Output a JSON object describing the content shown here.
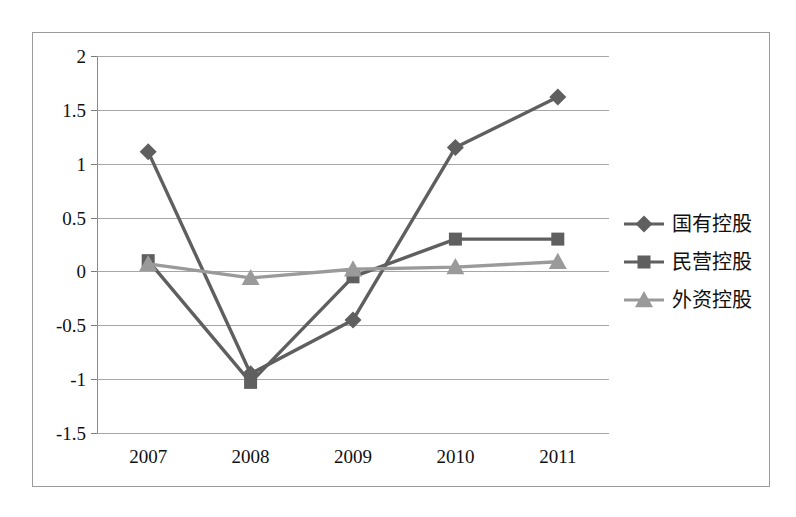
{
  "chart_data": {
    "type": "line",
    "title": "",
    "xlabel": "",
    "ylabel": "",
    "categories": [
      "2007",
      "2008",
      "2009",
      "2010",
      "2011"
    ],
    "ylim": [
      -1.5,
      2
    ],
    "yticks": [
      "2",
      "1.5",
      "1",
      "0.5",
      "0",
      "-0.5",
      "-1",
      "-1.5"
    ],
    "ytick_values": [
      2,
      1.5,
      1,
      0.5,
      0,
      -0.5,
      -1,
      -1.5
    ],
    "grid": true,
    "legend_position": "right",
    "series": [
      {
        "name": "国有控股",
        "marker": "diamond",
        "color": "#5f5f5f",
        "values": [
          1.11,
          -0.95,
          -0.45,
          1.15,
          1.62
        ]
      },
      {
        "name": "民营控股",
        "marker": "square",
        "color": "#5f5f5f",
        "values": [
          0.1,
          -1.03,
          -0.05,
          0.3,
          0.3
        ]
      },
      {
        "name": "外资控股",
        "marker": "triangle",
        "color": "#9a9a9a",
        "values": [
          0.07,
          -0.06,
          0.02,
          0.04,
          0.09
        ]
      }
    ]
  },
  "legend": {
    "items": [
      {
        "label": "国有控股"
      },
      {
        "label": "民营控股"
      },
      {
        "label": "外资控股"
      }
    ]
  },
  "colors": {
    "series_dark": "#5f5f5f",
    "series_light": "#9a9a9a",
    "gridline": "#a6a6a6",
    "frame": "#9b9b9b",
    "text": "#111111",
    "background": "#ffffff"
  }
}
